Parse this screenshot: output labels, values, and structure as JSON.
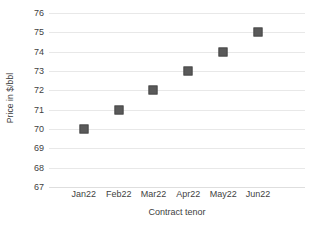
{
  "chart_data": {
    "type": "scatter",
    "title": "",
    "subtitle": "",
    "xlabel": "Contract tenor",
    "ylabel": "Price in $/bbl",
    "categories": [
      "Jan22",
      "Feb22",
      "Mar22",
      "Apr22",
      "May22",
      "Jun22"
    ],
    "values": [
      70,
      71,
      72,
      73,
      74,
      75
    ],
    "series": [
      {
        "name": "",
        "values": [
          70,
          71,
          72,
          73,
          74,
          75
        ]
      }
    ],
    "ylim": [
      67,
      76
    ],
    "yticks": [
      76,
      75,
      74,
      73,
      72,
      71,
      70,
      69,
      68,
      67
    ],
    "ytick_labels": [
      "76",
      "75",
      "74",
      "73",
      "72",
      "71",
      "70",
      "69",
      "68",
      "67"
    ],
    "grid": true,
    "grid_axis": "y",
    "legend": false,
    "legend_position": "none",
    "marker_shape": "square",
    "annotations": []
  },
  "style": {
    "background_color": "#ffffff",
    "marker_color": "#5a5a5a",
    "gridline_color": "#e8e8e8",
    "text_color": "#3f3f3f"
  }
}
